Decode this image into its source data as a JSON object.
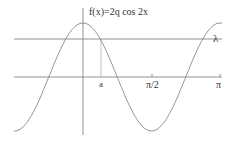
{
  "title": "f(x)=2q cos 2x",
  "labels": {
    "lambda": "λ",
    "a": "a",
    "half_pi": "π/2",
    "pi": "π"
  },
  "chart_data": {
    "type": "line",
    "title": "f(x)=2q cos 2x",
    "function": "2q cos 2x",
    "x_ticks": [
      "a",
      "π/2",
      "π"
    ],
    "horizontal_line": {
      "label": "λ",
      "description": "constant level λ below maximum 2q"
    },
    "x_range": [
      "-π/2 (approx)",
      "π"
    ],
    "annotations": [
      "vertical marker at x=a where curve meets λ line"
    ]
  }
}
